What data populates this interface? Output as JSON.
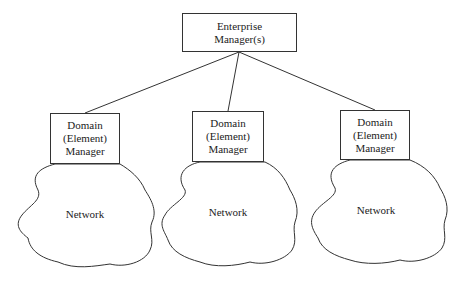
{
  "diagram": {
    "top": {
      "line1": "Enterprise",
      "line2": "Manager(s)"
    },
    "domains": [
      {
        "line1": "Domain",
        "line2": "(Element)",
        "line3": "Manager",
        "network": "Network"
      },
      {
        "line1": "Domain",
        "line2": "(Element)",
        "line3": "Manager",
        "network": "Network"
      },
      {
        "line1": "Domain",
        "line2": "(Element)",
        "line3": "Manager",
        "network": "Network"
      }
    ]
  }
}
